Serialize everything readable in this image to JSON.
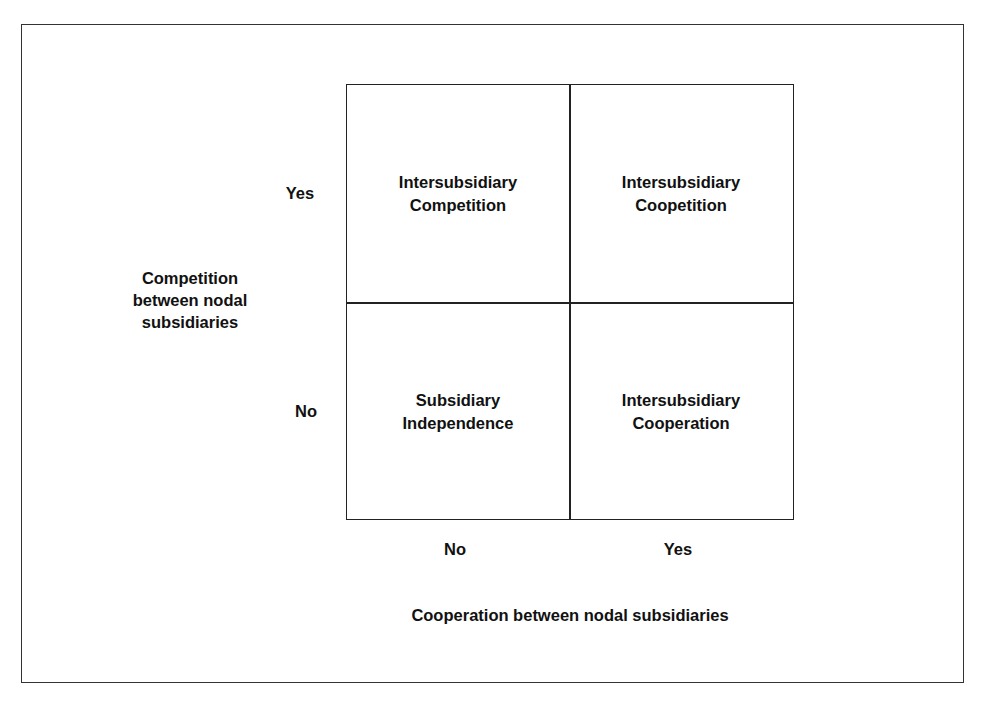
{
  "diagram": {
    "type": "2x2-matrix",
    "y_axis": {
      "title_lines": [
        "Competition",
        "between nodal",
        "subsidiaries"
      ],
      "ticks": [
        "Yes",
        "No"
      ]
    },
    "x_axis": {
      "title": "Cooperation between nodal subsidiaries",
      "ticks": [
        "No",
        "Yes"
      ]
    },
    "cells": {
      "top_left": [
        "Intersubsidiary",
        "Competition"
      ],
      "top_right": [
        "Intersubsidiary",
        "Coopetition"
      ],
      "bottom_left": [
        "Subsidiary",
        "Independence"
      ],
      "bottom_right": [
        "Intersubsidiary",
        "Cooperation"
      ]
    },
    "colors": {
      "line": "#222222",
      "text": "#111111",
      "background": "#ffffff"
    }
  }
}
